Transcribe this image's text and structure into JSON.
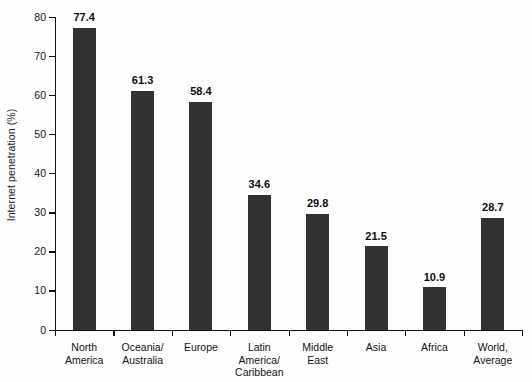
{
  "chart_data": {
    "type": "bar",
    "title": "",
    "subtitle": "",
    "xlabel": "",
    "ylabel": "Internet penetration (%)",
    "ylim": [
      0,
      80
    ],
    "yticks": [
      0,
      10,
      20,
      30,
      40,
      50,
      60,
      70,
      80
    ],
    "ytick_labels": [
      "0",
      "10",
      "20",
      "30",
      "40",
      "50",
      "60",
      "70",
      "80"
    ],
    "grid": false,
    "legend": null,
    "bar_color": "#333132",
    "categories": [
      "North\nAmerica",
      "Oceania/\nAustralia",
      "Europe",
      "Latin\nAmerica/\nCaribbean",
      "Middle\nEast",
      "Asia",
      "Africa",
      "World,\nAverage"
    ],
    "values": [
      77.4,
      61.3,
      58.4,
      34.6,
      29.8,
      21.5,
      10.9,
      28.7
    ],
    "data_labels": [
      "77.4",
      "61.3",
      "58.4",
      "34.6",
      "29.8",
      "21.5",
      "10.9",
      "28.7"
    ]
  }
}
